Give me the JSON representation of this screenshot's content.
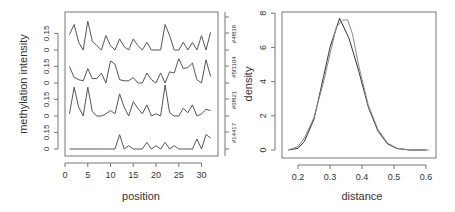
{
  "chart_data": [
    {
      "type": "line",
      "xlabel": "position",
      "ylabel": "methylation intensity",
      "x_ticks": [
        0,
        5,
        10,
        15,
        20,
        25,
        30
      ],
      "xlim": [
        0,
        33
      ],
      "band_y_ticks": [
        "0",
        "0.15"
      ],
      "band_ylim": [
        0,
        0.3
      ],
      "right_labels": [
        "#14417",
        "#6f821",
        "#5f1104",
        "#4f818"
      ],
      "x": [
        1,
        2,
        3,
        4,
        5,
        6,
        7,
        8,
        9,
        10,
        11,
        12,
        13,
        14,
        15,
        16,
        17,
        18,
        19,
        20,
        21,
        22,
        23,
        24,
        25,
        26,
        27,
        28,
        29,
        30,
        31,
        32
      ],
      "series": [
        {
          "name": "#14417",
          "values": [
            0,
            0,
            0,
            0,
            0,
            0,
            0,
            0,
            0,
            0,
            0,
            0.13,
            0,
            0.03,
            0,
            0,
            0,
            0.06,
            0,
            0.03,
            0,
            0.06,
            0,
            0.03,
            0,
            0,
            0,
            0,
            0.09,
            0,
            0.13,
            0.1
          ]
        },
        {
          "name": "#6f821",
          "values": [
            0.02,
            0.26,
            0.08,
            0,
            0.26,
            0.04,
            0,
            0,
            0.02,
            0.05,
            0.02,
            0.2,
            0.08,
            0,
            0.13,
            0.07,
            0.02,
            0.1,
            0,
            0.02,
            0,
            0.28,
            0.03,
            0,
            0,
            0.07,
            0.03,
            0.1,
            0,
            0.02,
            0.06,
            0.05
          ]
        },
        {
          "name": "#5f1104",
          "values": [
            0.15,
            0.05,
            0.03,
            0.02,
            0.13,
            0.04,
            0.04,
            0.09,
            0,
            0.2,
            0.17,
            0.03,
            0.02,
            0.02,
            0.05,
            0,
            0,
            0.09,
            0.03,
            0,
            0.09,
            0,
            0.1,
            0.09,
            0.22,
            0.13,
            0.14,
            0.18,
            0.03,
            0,
            0.21,
            0.06
          ]
        },
        {
          "name": "#4f818",
          "values": [
            0.14,
            0.23,
            0.07,
            0,
            0.26,
            0.08,
            0.04,
            0,
            0.13,
            0.04,
            0,
            0.1,
            0.03,
            0,
            0.1,
            0.04,
            0,
            0.07,
            0,
            0,
            0,
            0.23,
            0.13,
            0,
            0,
            0.07,
            0,
            0.07,
            0,
            0.13,
            0,
            0.16
          ]
        }
      ]
    },
    {
      "type": "line",
      "xlabel": "distance",
      "ylabel": "density",
      "x_ticks": [
        0.2,
        0.3,
        0.4,
        0.5,
        0.6
      ],
      "y_ticks": [
        0,
        2,
        4,
        6,
        8
      ],
      "xlim": [
        0.15,
        0.63
      ],
      "ylim": [
        0,
        8
      ],
      "series": [
        {
          "name": "density-dark",
          "x": [
            0.17,
            0.2,
            0.22,
            0.25,
            0.28,
            0.3,
            0.33,
            0.36,
            0.39,
            0.42,
            0.45,
            0.48,
            0.51,
            0.55,
            0.6
          ],
          "values": [
            0,
            0.1,
            0.5,
            1.8,
            4.3,
            6,
            7.7,
            6.5,
            4.6,
            2.5,
            1.1,
            0.35,
            0.08,
            0,
            0
          ]
        },
        {
          "name": "density-light",
          "x": [
            0.17,
            0.2,
            0.22,
            0.25,
            0.28,
            0.3,
            0.32,
            0.34,
            0.355,
            0.37,
            0.39,
            0.42,
            0.45,
            0.48,
            0.51,
            0.55,
            0.61
          ],
          "values": [
            0,
            0.2,
            0.7,
            1.9,
            4,
            5.6,
            7.2,
            7.6,
            7.6,
            6.8,
            4.9,
            2.6,
            1.2,
            0.4,
            0.1,
            0,
            0
          ]
        }
      ]
    }
  ]
}
